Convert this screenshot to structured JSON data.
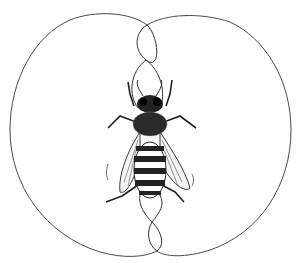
{
  "illustration": {
    "subject": "honey bee waggle dance",
    "style": "black ink line drawing on white",
    "colors": {
      "background": "#ffffff",
      "ink": "#1a1a1a",
      "path": "#4a4a4a"
    },
    "elements": [
      "left-loop",
      "right-loop",
      "waggle-run-path",
      "bee"
    ]
  }
}
